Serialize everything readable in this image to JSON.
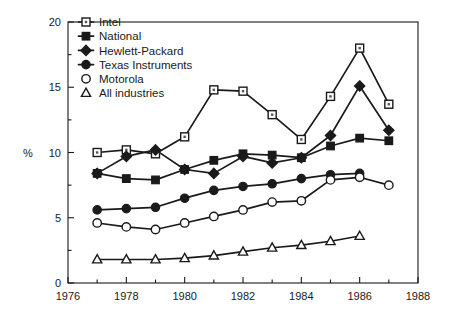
{
  "chart_data": {
    "type": "line",
    "title": "",
    "subtitle": "",
    "xlabel": "",
    "ylabel": "%",
    "xlim": [
      1976,
      1988
    ],
    "ylim": [
      0,
      20
    ],
    "x_ticks": [
      1976,
      1978,
      1980,
      1982,
      1984,
      1986,
      1988
    ],
    "x_tick_labels": [
      "1976",
      "1978",
      "1980",
      "1982",
      "1984",
      "1986",
      "1988"
    ],
    "x_minor_step": 1,
    "y_ticks": [
      0,
      5,
      10,
      15,
      20
    ],
    "y_tick_labels": [
      "0",
      "5",
      "10",
      "15",
      "20"
    ],
    "y_minor_step": 2.5,
    "grid": false,
    "legend_position": "top-left",
    "series": [
      {
        "name": "Intel",
        "marker": "open-square-dot",
        "x": [
          1977,
          1978,
          1979,
          1980,
          1981,
          1982,
          1983,
          1984,
          1985,
          1986,
          1987
        ],
        "values": [
          10.0,
          10.2,
          9.9,
          11.2,
          14.8,
          14.7,
          12.9,
          11.0,
          14.3,
          18.0,
          13.7
        ]
      },
      {
        "name": "National",
        "marker": "filled-square",
        "x": [
          1977,
          1978,
          1979,
          1980,
          1981,
          1982,
          1983,
          1984,
          1985,
          1986,
          1987
        ],
        "values": [
          8.4,
          8.0,
          7.9,
          8.7,
          9.4,
          9.9,
          9.8,
          9.6,
          10.5,
          11.1,
          10.9
        ]
      },
      {
        "name": "Hewlett-Packard",
        "marker": "filled-diamond",
        "x": [
          1977,
          1978,
          1979,
          1980,
          1981,
          1982,
          1983,
          1984,
          1985,
          1986,
          1987
        ],
        "values": [
          8.4,
          9.7,
          10.2,
          8.7,
          8.4,
          9.7,
          9.2,
          9.6,
          11.3,
          15.1,
          11.7
        ]
      },
      {
        "name": "Texas Instruments",
        "marker": "filled-circle",
        "x": [
          1977,
          1978,
          1979,
          1980,
          1981,
          1982,
          1983,
          1984,
          1985,
          1986
        ],
        "values": [
          5.6,
          5.7,
          5.8,
          6.5,
          7.1,
          7.4,
          7.6,
          8.0,
          8.3,
          8.4
        ]
      },
      {
        "name": "Motorola",
        "marker": "open-circle",
        "x": [
          1977,
          1978,
          1979,
          1980,
          1981,
          1982,
          1983,
          1984,
          1985,
          1986,
          1987
        ],
        "values": [
          4.6,
          4.3,
          4.1,
          4.6,
          5.1,
          5.6,
          6.2,
          6.3,
          7.9,
          8.1,
          7.5
        ]
      },
      {
        "name": "All industries",
        "marker": "open-triangle",
        "x": [
          1977,
          1978,
          1979,
          1980,
          1981,
          1982,
          1983,
          1984,
          1985,
          1986
        ],
        "values": [
          1.8,
          1.8,
          1.8,
          1.9,
          2.1,
          2.4,
          2.7,
          2.9,
          3.2,
          3.6
        ]
      }
    ]
  },
  "legend": {
    "items": [
      {
        "label": "Intel",
        "marker": "open-square-dot"
      },
      {
        "label": "National",
        "marker": "filled-square"
      },
      {
        "label": "Hewlett-Packard",
        "marker": "filled-diamond"
      },
      {
        "label": "Texas Instruments",
        "marker": "filled-circle"
      },
      {
        "label": "Motorola",
        "marker": "open-circle"
      },
      {
        "label": "All industries",
        "marker": "open-triangle"
      }
    ]
  },
  "axes": {
    "y_axis_title": "%"
  },
  "colors": {
    "ink": "#1a1a1a",
    "background": "#ffffff"
  }
}
